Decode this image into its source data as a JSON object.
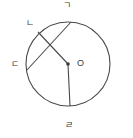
{
  "figure": {
    "type": "circle-geometry-diagram",
    "background_color": "#ffffff",
    "stroke_color": "#4a4a4a",
    "label_color": "#3a3a3a",
    "circle": {
      "center_x": 68,
      "center_y": 64,
      "radius": 42,
      "center_label": "O"
    },
    "points": [
      {
        "id": "top",
        "label": "ㄱ",
        "x": 71,
        "y": 22
      },
      {
        "id": "upperleft",
        "label": "ㄴ",
        "x": 38,
        "y": 32
      },
      {
        "id": "left",
        "label": "ㄷ",
        "x": 27,
        "y": 70
      },
      {
        "id": "bottom",
        "label": "ㄹ",
        "x": 70,
        "y": 106
      }
    ],
    "segments": [
      {
        "id": "chord-top-left",
        "from": "top",
        "to": "left",
        "kind": "chord"
      },
      {
        "id": "radius-upperleft",
        "from": "upperleft",
        "to": "center",
        "kind": "radius"
      },
      {
        "id": "radius-bottom",
        "from": "center",
        "to": "bottom",
        "kind": "radius"
      }
    ],
    "center_dot": {
      "x": 68,
      "y": 64,
      "r": 1.8
    }
  },
  "labels": {
    "top": "ㄱ",
    "upper_left": "ㄴ",
    "left": "ㄷ",
    "bottom": "ㄹ",
    "center": "O"
  }
}
